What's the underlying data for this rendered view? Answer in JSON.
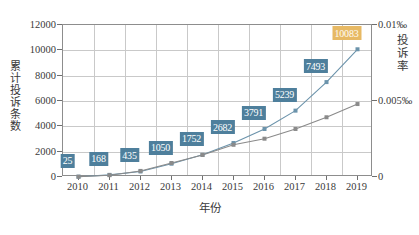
{
  "chart_data": {
    "type": "line",
    "title": "",
    "xlabel": "年份",
    "ylabel": "累计投诉条数",
    "y2label": "投诉率",
    "categories": [
      "2010",
      "2011",
      "2012",
      "2013",
      "2014",
      "2015",
      "2016",
      "2017",
      "2018",
      "2019"
    ],
    "ylim": [
      0,
      12000
    ],
    "yticks": [
      "0",
      "2000",
      "4000",
      "6000",
      "8000",
      "10000",
      "12000"
    ],
    "y2lim": [
      0,
      0.01
    ],
    "y2ticks": [
      "0",
      "0.005‰",
      "0.01‰"
    ],
    "grid": true,
    "legend": "none",
    "series": [
      {
        "name": "累计投诉条数",
        "axis": "left",
        "color": "#6b93ab",
        "values": [
          25,
          168,
          435,
          1050,
          1752,
          2682,
          3791,
          5239,
          7493,
          10083
        ],
        "labels": [
          "25",
          "168",
          "435",
          "1050",
          "1752",
          "2682",
          "3791",
          "5239",
          "7493",
          "10083"
        ],
        "label_colors": [
          "#4e7f9c",
          "#4e7f9c",
          "#4e7f9c",
          "#4e7f9c",
          "#4e7f9c",
          "#4e7f9c",
          "#4e7f9c",
          "#4e7f9c",
          "#4e7f9c",
          "#e7b964"
        ]
      },
      {
        "name": "投诉率",
        "axis": "right",
        "color": "#8a8a8a",
        "values": [
          2e-05,
          0.00012,
          0.0004,
          0.00092,
          0.00145,
          0.00212,
          0.00252,
          0.00316,
          0.00393,
          0.0048
        ]
      }
    ]
  },
  "axes": {
    "left_label": "累计投诉条数",
    "right_label": "投诉率",
    "bottom_label": "年份"
  }
}
